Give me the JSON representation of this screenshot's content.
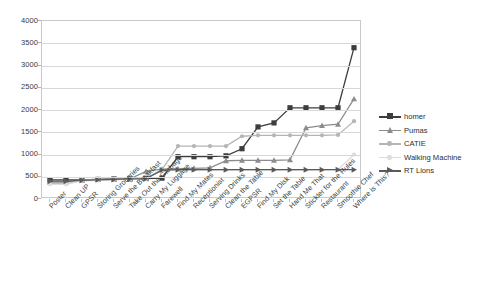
{
  "chart_data": {
    "type": "line",
    "title": "",
    "xlabel": "",
    "ylabel": "",
    "ylim": [
      0,
      4000
    ],
    "ytick_step": 500,
    "yticks": [
      0,
      500,
      1000,
      1500,
      2000,
      2500,
      3000,
      3500,
      4000
    ],
    "grid": true,
    "legend_position": "right",
    "categories": [
      "Poster",
      "Clean UP",
      "GPSR",
      "Storing Groceries",
      "Serve the Breakfast",
      "Take Out the Garbage",
      "Carry My Luggage",
      "Farewell",
      "Find My Mates",
      "Receptionist",
      "Serving Drinks",
      "Clean the Table",
      "EGPSR",
      "Find My Disk",
      "Set the Table",
      "Hand Me That",
      "Stickler for the Rules",
      "Restaurant",
      "Smoothie Chef",
      "Where is This?"
    ],
    "series": [
      {
        "name": "homer",
        "color": "#3d3d3d",
        "marker": "square",
        "values": [
          430,
          430,
          430,
          440,
          450,
          450,
          460,
          470,
          950,
          950,
          950,
          970,
          1130,
          1620,
          1710,
          2050,
          2050,
          2050,
          2050,
          3400
        ]
      },
      {
        "name": "Pumas",
        "color": "#8c8c8c",
        "marker": "triangle",
        "values": [
          380,
          380,
          430,
          440,
          450,
          455,
          620,
          670,
          680,
          690,
          700,
          860,
          870,
          870,
          870,
          880,
          1600,
          1650,
          1680,
          2250
        ]
      },
      {
        "name": "CATIE",
        "color": "#b5b5b5",
        "marker": "circle",
        "values": [
          350,
          340,
          420,
          430,
          440,
          450,
          460,
          660,
          1190,
          1190,
          1190,
          1190,
          1410,
          1430,
          1430,
          1430,
          1430,
          1430,
          1440,
          1750
        ]
      },
      {
        "name": "Walking Machine",
        "color": "#dcdcdc",
        "marker": "circle",
        "values": [
          330,
          330,
          410,
          420,
          430,
          440,
          450,
          640,
          650,
          650,
          650,
          650,
          650,
          650,
          650,
          650,
          650,
          650,
          660,
          1000
        ]
      },
      {
        "name": "RT Lions",
        "color": "#5a5a5a",
        "marker": "arrow-right",
        "values": [
          400,
          400,
          420,
          430,
          440,
          450,
          460,
          650,
          660,
          660,
          660,
          660,
          660,
          660,
          660,
          660,
          660,
          660,
          660,
          660
        ]
      }
    ]
  },
  "legend": {
    "items": [
      {
        "label": "homer"
      },
      {
        "label": "Pumas"
      },
      {
        "label": "CATIE"
      },
      {
        "label": "Walking Machine"
      },
      {
        "label": "RT Lions"
      }
    ]
  }
}
